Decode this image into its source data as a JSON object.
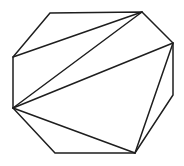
{
  "figure": {
    "type": "polygon-triangulation",
    "canvas": {
      "width": 184,
      "height": 166,
      "background": "#ffffff"
    },
    "stroke": {
      "color": "#1e1e1e",
      "width": 1.5
    },
    "polygon": {
      "shape": "octagon",
      "vertex_count": 8,
      "vertices": [
        {
          "id": "top-left",
          "x": 50,
          "y": 13
        },
        {
          "id": "top-right",
          "x": 142,
          "y": 12
        },
        {
          "id": "right-upper",
          "x": 173,
          "y": 43
        },
        {
          "id": "right-lower",
          "x": 173,
          "y": 95
        },
        {
          "id": "bottom-right",
          "x": 135,
          "y": 153
        },
        {
          "id": "bottom-left",
          "x": 55,
          "y": 153
        },
        {
          "id": "left-lower",
          "x": 13,
          "y": 108
        },
        {
          "id": "left-upper",
          "x": 13,
          "y": 57
        }
      ]
    },
    "diagonals": [
      {
        "from": "left-upper",
        "to": "top-right"
      },
      {
        "from": "left-lower",
        "to": "top-right"
      },
      {
        "from": "left-lower",
        "to": "right-upper"
      },
      {
        "from": "left-lower",
        "to": "bottom-right"
      },
      {
        "from": "bottom-right",
        "to": "right-upper"
      }
    ],
    "triangle_count": 6
  }
}
